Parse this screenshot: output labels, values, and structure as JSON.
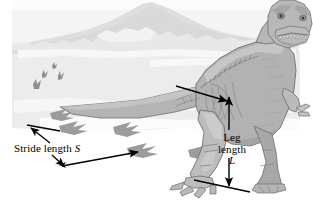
{
  "figure": {
    "scene_description": "Tyrannosaurus standing on sand with trackway of three-toed footprints, distant mountain background",
    "labels": {
      "stride_text": "Stride length",
      "stride_symbol": "S",
      "leg_line1": "Leg",
      "leg_line2": "length",
      "leg_symbol": "L"
    },
    "annotations": [
      {
        "name": "stride-length-measure",
        "label": "Stride length S",
        "type": "double-headed-arrow",
        "measures": "distance between successive same-foot footprints"
      },
      {
        "name": "leg-length-measure",
        "label": "Leg length L",
        "type": "double-headed-arrow",
        "measures": "vertical distance from hip to ground"
      },
      {
        "name": "hip-pointer-arrow",
        "label": "",
        "type": "single-headed-arrow",
        "measures": "pointer from hip joint to leg length arrow"
      }
    ],
    "footprints": {
      "distant_count": 4,
      "trackway_count": 5,
      "toes_per_print": 3
    },
    "colors": {
      "background": "#ffffff",
      "sky": "#f2f2f2",
      "mountain": "#dcdcdc",
      "mountain_far": "#e6e6e6",
      "ground": "#e9e9e9",
      "dinosaur_body": "#b0b0b0",
      "dinosaur_shade": "#9a9a9a",
      "dinosaur_light": "#c8c8c8",
      "outline": "#6b6b6b",
      "footprint": "#9e9e9e",
      "footprint_far": "#8a8a8a",
      "arrow": "#000000",
      "text": "#000000"
    }
  }
}
